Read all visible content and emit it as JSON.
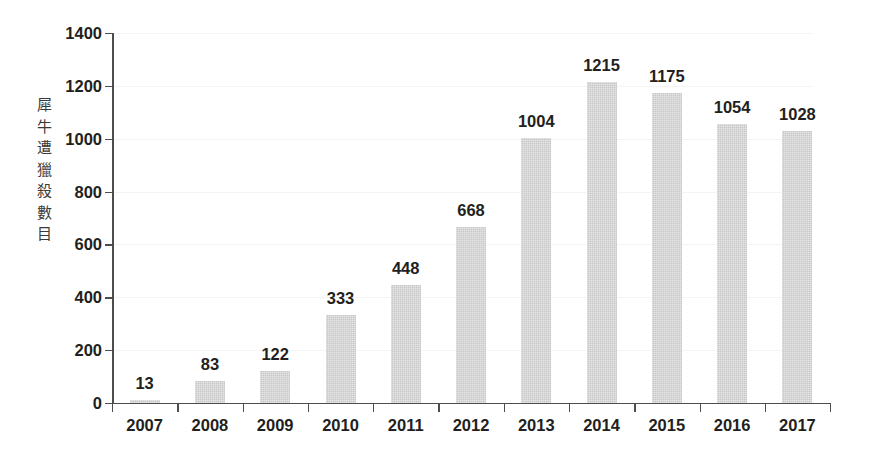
{
  "chart_data": {
    "type": "bar",
    "title": "",
    "subtitle": "",
    "xlabel": "",
    "ylabel": "犀牛遭獵殺數目",
    "ylabel_chars": [
      "犀",
      "牛",
      "遭",
      "獵",
      "殺",
      "數",
      "目"
    ],
    "categories": [
      "2007",
      "2008",
      "2009",
      "2010",
      "2011",
      "2012",
      "2013",
      "2014",
      "2015",
      "2016",
      "2017"
    ],
    "values": [
      13,
      83,
      122,
      333,
      448,
      668,
      1004,
      1215,
      1175,
      1054,
      1028
    ],
    "value_labels": [
      "13",
      "83",
      "122",
      "333",
      "448",
      "668",
      "1004",
      "1215",
      "1175",
      "1054",
      "1028"
    ],
    "ylim": [
      0,
      1400
    ],
    "ytick_values": [
      0,
      200,
      400,
      600,
      800,
      1000,
      1200,
      1400
    ],
    "ytick_labels": [
      "0",
      "200",
      "400",
      "600",
      "800",
      "1000",
      "1200",
      "1400"
    ],
    "grid": true,
    "grid_axis": "y",
    "legend": false,
    "bar_color": "#c9c9c9",
    "axis_color": "#4d4d4d",
    "text_color": "#231f20",
    "background_color": "#ffffff"
  }
}
